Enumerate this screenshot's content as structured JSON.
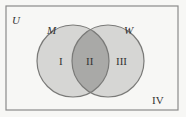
{
  "diagram": {
    "type": "venn",
    "universe_label": "U",
    "sets": [
      {
        "name": "M",
        "region_label": "I"
      },
      {
        "name": "W",
        "region_label": "III"
      }
    ],
    "intersection_label": "II",
    "outside_label": "IV",
    "colors": {
      "background": "#f7f7f5",
      "border": "#888888",
      "circle_fill": "#d6d6d4",
      "intersection_fill": "#a9a9a7",
      "circle_stroke": "#7a7a78"
    }
  }
}
